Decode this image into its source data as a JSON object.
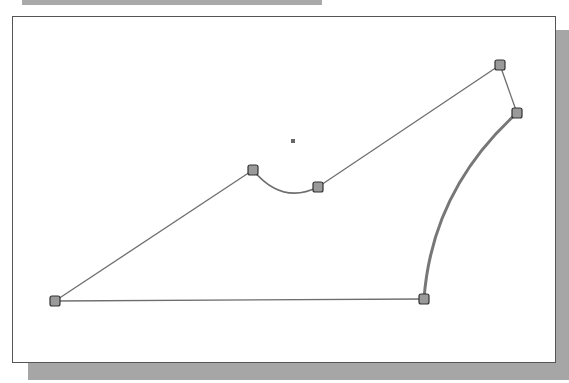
{
  "sketch": {
    "points": [
      {
        "name": "p1",
        "x": 55,
        "y": 301
      },
      {
        "name": "p2",
        "x": 253,
        "y": 170
      },
      {
        "name": "p3",
        "x": 318,
        "y": 187
      },
      {
        "name": "p4",
        "x": 500,
        "y": 65
      },
      {
        "name": "p5",
        "x": 517,
        "y": 113
      },
      {
        "name": "p6",
        "x": 424,
        "y": 299
      }
    ],
    "center_mark": {
      "x": 293,
      "y": 141
    },
    "colors": {
      "line": "#6e6e6e",
      "arc_thick": "#777777",
      "vertex_fill": "#9a9a9a",
      "vertex_stroke": "#333333"
    }
  }
}
